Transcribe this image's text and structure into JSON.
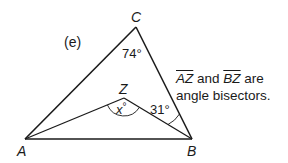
{
  "problem_label": "(e)",
  "vertices": {
    "A": {
      "label": "A",
      "x": 25,
      "y": 139
    },
    "B": {
      "label": "B",
      "x": 192,
      "y": 139
    },
    "C": {
      "label": "C",
      "x": 136,
      "y": 27
    },
    "Z": {
      "label": "Z",
      "x": 124,
      "y": 98
    }
  },
  "angles": {
    "C": "74°",
    "Z_var": "x",
    "Z_deg": "°",
    "B_half": "31°"
  },
  "note": {
    "seg1": "AZ",
    "and": " and ",
    "seg2": "BZ",
    "are": " are",
    "line2": "angle bisectors."
  },
  "colors": {
    "stroke": "#1a1a1a",
    "background": "#ffffff"
  }
}
